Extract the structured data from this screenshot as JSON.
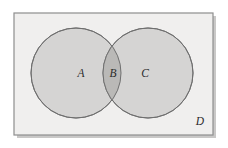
{
  "diagram": {
    "type": "venn-2-set",
    "canvas": {
      "width": 228,
      "height": 148,
      "background": "#ffffff"
    },
    "universe": {
      "label": "D",
      "shape": "rectangle",
      "fill": "#f0efee",
      "stroke": "#8e8e8e",
      "x": 14,
      "y": 13,
      "width": 199,
      "height": 122,
      "label_x": 200,
      "label_y": 122
    },
    "regions": [
      {
        "label": "A",
        "description": "left circle only",
        "fill": "#d5d4d3",
        "stroke": "#6f6f6f",
        "cx": 76,
        "cy": 73,
        "r": 45,
        "label_x": 81,
        "label_y": 74
      },
      {
        "label": "B",
        "description": "intersection of both circles",
        "fill": "#bab9b7",
        "stroke": "#6f6f6f",
        "label_x": 113,
        "label_y": 74
      },
      {
        "label": "C",
        "description": "right circle only",
        "fill": "#d5d4d3",
        "stroke": "#6f6f6f",
        "cx": 148,
        "cy": 73,
        "r": 45,
        "label_x": 145,
        "label_y": 74
      }
    ],
    "colors": {
      "circle_fill": "#d5d4d3",
      "overlap_fill": "#bab9b7",
      "universe_fill": "#f0efee",
      "circle_stroke": "#6f6f6f",
      "universe_stroke": "#8e8e8e",
      "label_color": "#2b2b2b",
      "shadow": "#c9c8c7"
    }
  }
}
